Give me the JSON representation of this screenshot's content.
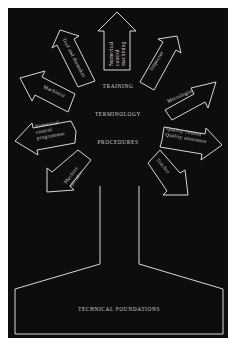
{
  "diagram": {
    "base_label": "TECHNICAL FOUNDATIONS",
    "center_labels": {
      "training": "TRAINING",
      "terminology": "TERMINOLOGY",
      "procedures": "PROCEDURES"
    },
    "arrows": [
      {
        "id": "nc-machining",
        "lines": [
          "Numerical",
          "control",
          "machining"
        ]
      },
      {
        "id": "tool-die",
        "lines": [
          "Tool and diemaker"
        ]
      },
      {
        "id": "inspector",
        "lines": [
          "Inspector"
        ]
      },
      {
        "id": "machinist",
        "lines": [
          "Machinist"
        ]
      },
      {
        "id": "metrologist",
        "lines": [
          "Metrologist"
        ]
      },
      {
        "id": "nc-programmer",
        "lines": [
          "Numerical",
          "control",
          "programmer"
        ]
      },
      {
        "id": "qc-qa",
        "lines": [
          "Quality control",
          "Quality assurance"
        ]
      },
      {
        "id": "machine-operator",
        "lines": [
          "Machine",
          "operator"
        ]
      },
      {
        "id": "teacher",
        "lines": [
          "Teacher"
        ]
      }
    ]
  },
  "colors": {
    "background": "#0d0d0d",
    "page": "#ffffff",
    "stroke": "#d8d8d8"
  }
}
